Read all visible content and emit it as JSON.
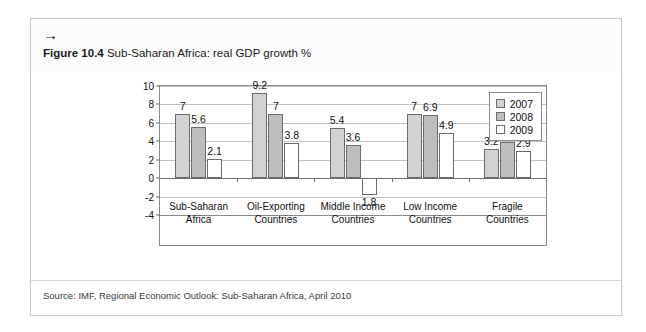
{
  "figure": {
    "arrow_icon": "→",
    "number_label": "Figure 10.4",
    "title": "Sub-Saharan Africa: real GDP growth %"
  },
  "source": {
    "text": "Source: IMF, Regional Economic Outlook: Sub-Saharan Africa, April 2010"
  },
  "colors": {
    "series_2007": "#d2d2d2",
    "series_2008": "#bdbdbd",
    "series_2009": "#ffffff",
    "bar_outline": "#6b6b6b",
    "axis": "#8a8a8a",
    "gridline": "#c2c2c2",
    "text": "#111111"
  },
  "chart_data": {
    "type": "bar",
    "title": "Sub-Saharan Africa: real GDP growth %",
    "xlabel": "",
    "ylabel": "",
    "ylim": [
      -4,
      10
    ],
    "yticks": [
      -4,
      -2,
      0,
      2,
      4,
      6,
      8,
      10
    ],
    "ytick_labels": [
      "-4",
      "-2",
      "0",
      "2",
      "4",
      "6",
      "8",
      "10"
    ],
    "grid": true,
    "legend_position": "top-right",
    "categories": [
      "Sub-Saharan\nAfrica",
      "Oil-Exporting\nCountries",
      "Middle Income\nCountries",
      "Low Income\nCountries",
      "Fragile\nCountries"
    ],
    "category_lines": [
      [
        "Sub-Saharan",
        "Africa"
      ],
      [
        "Oil-Exporting",
        "Countries"
      ],
      [
        "Middle Income",
        "Countries"
      ],
      [
        "Low Income",
        "Countries"
      ],
      [
        "Fragile",
        "Countries"
      ]
    ],
    "series": [
      {
        "name": "2007",
        "values": [
          7,
          9.2,
          5.4,
          7,
          3.2
        ],
        "labels": [
          "7",
          "9.2",
          "5.4",
          "7",
          "3.2"
        ]
      },
      {
        "name": "2008",
        "values": [
          5.6,
          7,
          3.6,
          6.9,
          3.9
        ],
        "labels": [
          "5.6",
          "7",
          "3.6",
          "6.9",
          "3.9"
        ]
      },
      {
        "name": "2009",
        "values": [
          2.1,
          3.8,
          -1.8,
          4.9,
          2.9
        ],
        "labels": [
          "2.1",
          "3.8",
          "1.8",
          "4.9",
          "2.9"
        ]
      }
    ],
    "legend": [
      "2007",
      "2008",
      "2009"
    ]
  }
}
